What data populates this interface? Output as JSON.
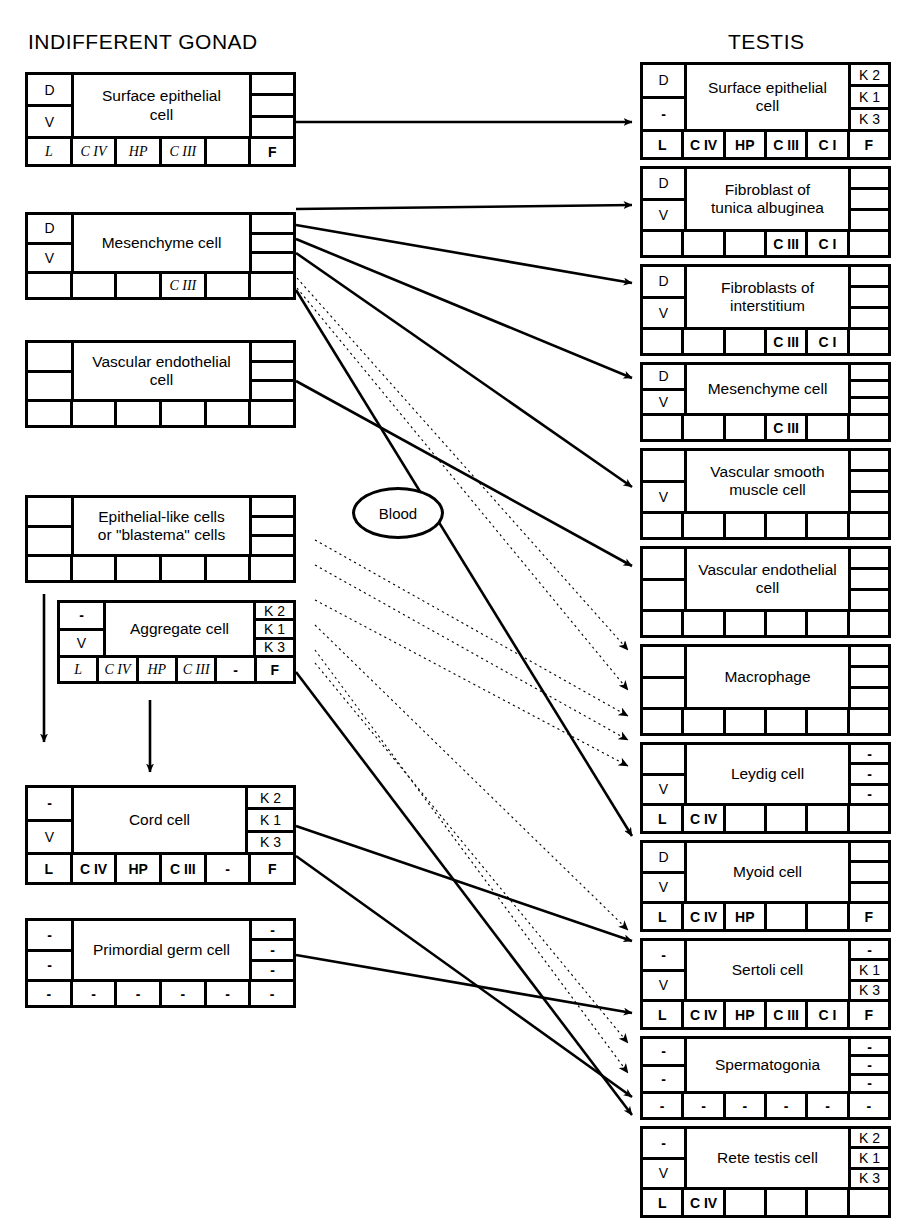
{
  "headers": {
    "left": "INDIFFERENT GONAD",
    "right": "TESTIS"
  },
  "blood": {
    "label": "Blood"
  },
  "legend_symbols": {
    "dash": "-",
    "dorsal": "D",
    "ventral": "V",
    "laminin": "L",
    "collagen_iv": "C IV",
    "heparan_sulfate_proteoglycan": "HP",
    "collagen_iii": "C III",
    "collagen_i": "C I",
    "fibronectin": "F",
    "keratin2": "K 2",
    "keratin1": "K 1",
    "keratin3": "K 3"
  },
  "left_column": [
    {
      "id": "surface-epithelial-cell",
      "name": "Surface epithelial\ncell",
      "left_cells": [
        "D",
        "V"
      ],
      "right_cells": [
        "",
        "",
        ""
      ],
      "footer": [
        "L",
        "C IV",
        "HP",
        "C III",
        "",
        "F"
      ],
      "footer_style": [
        "ital",
        "ital",
        "ital",
        "ital",
        "",
        "bold"
      ]
    },
    {
      "id": "mesenchyme-cell",
      "name": "Mesenchyme cell",
      "left_cells": [
        "D",
        "V"
      ],
      "right_cells": [
        "",
        "",
        ""
      ],
      "footer": [
        "",
        "",
        "",
        "C III",
        "",
        ""
      ],
      "footer_style": [
        "",
        "",
        "",
        "ital",
        "",
        ""
      ]
    },
    {
      "id": "vascular-endothelial-cell",
      "name": "Vascular endothelial\ncell",
      "left_cells": [
        "",
        ""
      ],
      "right_cells": [
        "",
        "",
        ""
      ],
      "footer": [
        "",
        "",
        "",
        "",
        "",
        ""
      ],
      "footer_style": [
        "",
        "",
        "",
        "",
        "",
        ""
      ]
    },
    {
      "id": "epithelial-like-cells",
      "name": "Epithelial-like cells\nor \"blastema\" cells",
      "left_cells": [
        "",
        ""
      ],
      "right_cells": [
        "",
        "",
        ""
      ],
      "footer": [
        "",
        "",
        "",
        "",
        "",
        ""
      ],
      "footer_style": [
        "",
        "",
        "",
        "",
        "",
        ""
      ]
    },
    {
      "id": "aggregate-cell",
      "name": "Aggregate cell",
      "left_cells": [
        "-",
        "V"
      ],
      "right_cells": [
        "K 2",
        "K 1",
        "K 3"
      ],
      "footer": [
        "L",
        "C IV",
        "HP",
        "C III",
        "-",
        "F"
      ],
      "footer_style": [
        "ital",
        "ital",
        "ital",
        "ital",
        "dash",
        "bold"
      ]
    },
    {
      "id": "cord-cell",
      "name": "Cord cell",
      "left_cells": [
        "-",
        "V"
      ],
      "right_cells": [
        "K 2",
        "K 1",
        "K 3"
      ],
      "footer": [
        "L",
        "C IV",
        "HP",
        "C III",
        "-",
        "F"
      ],
      "footer_style": [
        "bold",
        "bold",
        "bold",
        "bold",
        "dash",
        "bold"
      ]
    },
    {
      "id": "primordial-germ-cell",
      "name": "Primordial germ cell",
      "left_cells": [
        "-",
        "-"
      ],
      "right_cells": [
        "-",
        "-",
        "-"
      ],
      "footer": [
        "-",
        "-",
        "-",
        "-",
        "-",
        "-"
      ],
      "footer_style": [
        "dash",
        "dash",
        "dash",
        "dash",
        "dash",
        "dash"
      ]
    }
  ],
  "right_column": [
    {
      "id": "surface-epithelial-cell",
      "name": "Surface epithelial\ncell",
      "left_cells": [
        "D",
        "-"
      ],
      "right_cells": [
        "K 2",
        "K 1",
        "K 3"
      ],
      "footer": [
        "L",
        "C IV",
        "HP",
        "C III",
        "C I",
        "F"
      ],
      "footer_style": [
        "bold",
        "bold",
        "bold",
        "bold",
        "bold",
        "bold"
      ]
    },
    {
      "id": "fibroblast-of-tunica-albuginea",
      "name": "Fibroblast of\ntunica albuginea",
      "left_cells": [
        "D",
        "V"
      ],
      "right_cells": [
        "",
        "",
        ""
      ],
      "footer": [
        "",
        "",
        "",
        "C III",
        "C I",
        ""
      ],
      "footer_style": [
        "",
        "",
        "",
        "bold",
        "bold",
        ""
      ]
    },
    {
      "id": "fibroblasts-of-interstitium",
      "name": "Fibroblasts of\ninterstitium",
      "left_cells": [
        "D",
        "V"
      ],
      "right_cells": [
        "",
        "",
        ""
      ],
      "footer": [
        "",
        "",
        "",
        "C III",
        "C I",
        ""
      ],
      "footer_style": [
        "",
        "",
        "",
        "bold",
        "bold",
        ""
      ]
    },
    {
      "id": "mesenchyme-cell",
      "name": "Mesenchyme cell",
      "left_cells": [
        "D",
        "V"
      ],
      "right_cells": [
        "",
        "",
        ""
      ],
      "footer": [
        "",
        "",
        "",
        "C III",
        "",
        ""
      ],
      "footer_style": [
        "",
        "",
        "",
        "bold",
        "",
        ""
      ]
    },
    {
      "id": "vascular-smooth-muscle-cell",
      "name": "Vascular smooth\nmuscle cell",
      "left_cells": [
        "",
        "V"
      ],
      "right_cells": [
        "",
        "",
        ""
      ],
      "footer": [
        "",
        "",
        "",
        "",
        "",
        ""
      ],
      "footer_style": [
        "",
        "",
        "",
        "",
        "",
        ""
      ]
    },
    {
      "id": "vascular-endothelial-cell",
      "name": "Vascular endothelial\ncell",
      "left_cells": [
        "",
        ""
      ],
      "right_cells": [
        "",
        "",
        ""
      ],
      "footer": [
        "",
        "",
        "",
        "",
        "",
        ""
      ],
      "footer_style": [
        "",
        "",
        "",
        "",
        "",
        ""
      ]
    },
    {
      "id": "macrophage",
      "name": "Macrophage",
      "left_cells": [
        "",
        ""
      ],
      "right_cells": [
        "",
        "",
        ""
      ],
      "footer": [
        "",
        "",
        "",
        "",
        "",
        ""
      ],
      "footer_style": [
        "",
        "",
        "",
        "",
        "",
        ""
      ]
    },
    {
      "id": "leydig-cell",
      "name": "Leydig cell",
      "left_cells": [
        "",
        "V"
      ],
      "right_cells": [
        "-",
        "-",
        "-"
      ],
      "footer": [
        "L",
        "C IV",
        "",
        "",
        "",
        ""
      ],
      "footer_style": [
        "bold",
        "bold",
        "",
        "",
        "",
        ""
      ]
    },
    {
      "id": "myoid-cell",
      "name": "Myoid cell",
      "left_cells": [
        "D",
        "V"
      ],
      "right_cells": [
        "",
        "",
        ""
      ],
      "footer": [
        "L",
        "C IV",
        "HP",
        "",
        "",
        "F"
      ],
      "footer_style": [
        "bold",
        "bold",
        "bold",
        "",
        "",
        "bold"
      ]
    },
    {
      "id": "sertoli-cell",
      "name": "Sertoli cell",
      "left_cells": [
        "-",
        "V"
      ],
      "right_cells": [
        "-",
        "K 1",
        "K 3"
      ],
      "footer": [
        "L",
        "C IV",
        "HP",
        "C III",
        "C I",
        "F"
      ],
      "footer_style": [
        "bold",
        "bold",
        "bold",
        "bold",
        "bold",
        "bold"
      ]
    },
    {
      "id": "spermatogonia",
      "name": "Spermatogonia",
      "left_cells": [
        "-",
        "-"
      ],
      "right_cells": [
        "-",
        "-",
        "-"
      ],
      "footer": [
        "-",
        "-",
        "-",
        "-",
        "-",
        "-"
      ],
      "footer_style": [
        "dash",
        "dash",
        "dash",
        "dash",
        "dash",
        "dash"
      ]
    },
    {
      "id": "rete-testis-cell",
      "name": "Rete testis cell",
      "left_cells": [
        "-",
        "V"
      ],
      "right_cells": [
        "K 2",
        "K 1",
        "K 3"
      ],
      "footer": [
        "L",
        "C IV",
        "",
        "",
        "",
        ""
      ],
      "footer_style": [
        "bold",
        "bold",
        "",
        "",
        "",
        ""
      ]
    }
  ],
  "connections": {
    "solid": [
      {
        "from": "surface-epithelial-cell",
        "to": "surface-epithelial-cell"
      },
      {
        "from": "mesenchyme-cell",
        "to": "fibroblast-of-tunica-albuginea"
      },
      {
        "from": "mesenchyme-cell",
        "to": "fibroblasts-of-interstitium"
      },
      {
        "from": "mesenchyme-cell",
        "to": "mesenchyme-cell"
      },
      {
        "from": "mesenchyme-cell",
        "to": "vascular-smooth-muscle-cell"
      },
      {
        "from": "mesenchyme-cell",
        "to": "myoid-cell"
      },
      {
        "from": "vascular-endothelial-cell",
        "to": "vascular-endothelial-cell"
      },
      {
        "from": "aggregate-cell",
        "to": "rete-testis-cell"
      },
      {
        "from": "cord-cell",
        "to": "sertoli-cell"
      },
      {
        "from": "cord-cell",
        "to": "rete-testis-cell"
      },
      {
        "from": "primordial-germ-cell",
        "to": "spermatogonia"
      }
    ],
    "dotted": [
      {
        "from": "blood",
        "to": "macrophage"
      },
      {
        "from": "blood",
        "to": "leydig-cell"
      },
      {
        "from": "blood",
        "to": "myoid-cell"
      },
      {
        "from": "blood",
        "to": "sertoli-cell"
      },
      {
        "from": "blood",
        "to": "spermatogonia"
      }
    ]
  }
}
